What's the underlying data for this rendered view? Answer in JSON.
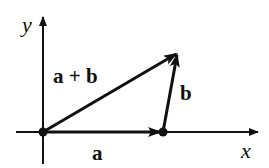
{
  "diagram": {
    "axes": {
      "x_label": "x",
      "y_label": "y"
    },
    "vectors": [
      {
        "id": "a",
        "label": "a",
        "from": "origin",
        "to": "point-a"
      },
      {
        "id": "b",
        "label": "b",
        "from": "point-a",
        "to": "tip"
      },
      {
        "id": "a-plus-b",
        "label": "a + b",
        "from": "origin",
        "to": "tip"
      }
    ],
    "colors": {
      "ink": "#111111",
      "background": "#ffffff"
    }
  }
}
